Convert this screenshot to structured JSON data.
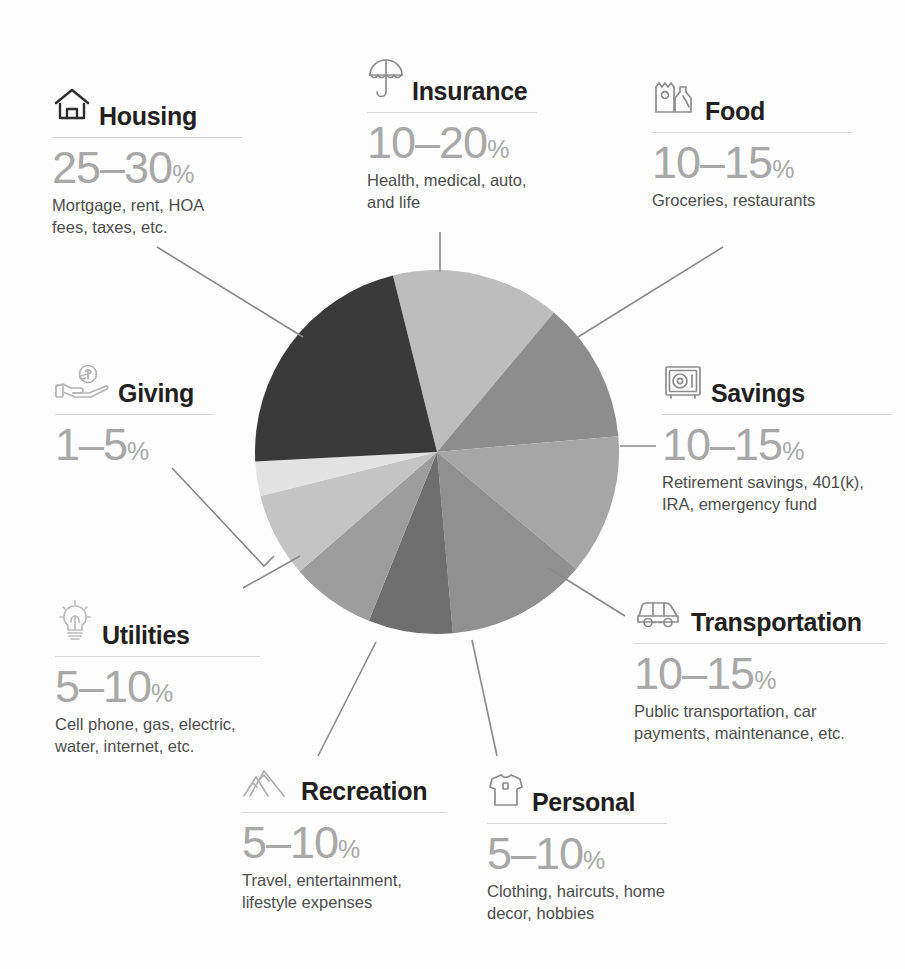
{
  "chart_data": {
    "type": "pie",
    "grid": false,
    "legend": "around-chart-callouts",
    "categories": [
      "Insurance",
      "Food",
      "Savings",
      "Transportation",
      "Personal",
      "Recreation",
      "Utilities",
      "Giving",
      "Housing"
    ],
    "values": [
      15,
      12.5,
      12.5,
      12.5,
      7.5,
      7.5,
      7.5,
      3,
      27.5
    ],
    "units": "percent",
    "slices": [
      {
        "label": "Insurance",
        "range": "10-20%",
        "min": 10,
        "max": 20,
        "value": 15,
        "color": "#bdbdbd",
        "start_angle": -14,
        "sweep": 54
      },
      {
        "label": "Food",
        "range": "10-15%",
        "min": 10,
        "max": 15,
        "value": 12.5,
        "color": "#8d8d8d",
        "start_angle": 40,
        "sweep": 45
      },
      {
        "label": "Savings",
        "range": "10-15%",
        "min": 10,
        "max": 15,
        "value": 12.5,
        "color": "#a6a6a6",
        "start_angle": 85,
        "sweep": 45
      },
      {
        "label": "Transportation",
        "range": "10-15%",
        "min": 10,
        "max": 15,
        "value": 12.5,
        "color": "#909090",
        "start_angle": 130,
        "sweep": 45
      },
      {
        "label": "Personal",
        "range": "5-10%",
        "min": 5,
        "max": 10,
        "value": 7.5,
        "color": "#6e6e6e",
        "start_angle": 175,
        "sweep": 27
      },
      {
        "label": "Recreation",
        "range": "5-10%",
        "min": 5,
        "max": 10,
        "value": 7.5,
        "color": "#9d9d9d",
        "start_angle": 202,
        "sweep": 27
      },
      {
        "label": "Utilities",
        "range": "5-10%",
        "min": 5,
        "max": 10,
        "value": 7.5,
        "color": "#c4c4c4",
        "start_angle": 229,
        "sweep": 27
      },
      {
        "label": "Giving",
        "range": "1-5%",
        "min": 1,
        "max": 5,
        "value": 3,
        "color": "#e2e2e2",
        "start_angle": 256,
        "sweep": 11
      },
      {
        "label": "Housing",
        "range": "25-30%",
        "min": 25,
        "max": 30,
        "value": 27.5,
        "color": "#3a3a3a",
        "start_angle": 267,
        "sweep": 79
      }
    ],
    "center": {
      "x": 437,
      "y": 452
    },
    "radius": 182
  },
  "categories": {
    "housing": {
      "title": "Housing",
      "percent": "25–30",
      "unit": "%",
      "desc": "Mortgage, rent, HOA fees, taxes, etc.",
      "icon": "house-icon"
    },
    "insurance": {
      "title": "Insurance",
      "percent": "10–20",
      "unit": "%",
      "desc": "Health, medical, auto, and life",
      "icon": "umbrella-icon"
    },
    "food": {
      "title": "Food",
      "percent": "10–15",
      "unit": "%",
      "desc": "Groceries, restaurants",
      "icon": "grocery-bag-icon"
    },
    "savings": {
      "title": "Savings",
      "percent": "10–15",
      "unit": "%",
      "desc": "Retirement savings, 401(k), IRA, emergency fund",
      "icon": "safe-icon"
    },
    "transportation": {
      "title": "Transportation",
      "percent": "10–15",
      "unit": "%",
      "desc": "Public transportation, car payments, maintenance, etc.",
      "icon": "car-icon"
    },
    "personal": {
      "title": "Personal",
      "percent": "5–10",
      "unit": "%",
      "desc": "Clothing, haircuts, home decor, hobbies",
      "icon": "tshirt-icon"
    },
    "recreation": {
      "title": "Recreation",
      "percent": "5–10",
      "unit": "%",
      "desc": "Travel, entertainment, lifestyle expenses",
      "icon": "mountains-icon"
    },
    "utilities": {
      "title": "Utilities",
      "percent": "5–10",
      "unit": "%",
      "desc": "Cell phone, gas, electric, water, internet, etc.",
      "icon": "lightbulb-icon"
    },
    "giving": {
      "title": "Giving",
      "percent": "1–5",
      "unit": "%",
      "desc": "",
      "icon": "hand-coin-icon"
    }
  },
  "colors": {
    "background": "#fdfdfd",
    "title_text": "#231f20",
    "percent_text": "#a8a8a8",
    "desc_text": "#4d4d4d",
    "rule": "#d9d9d9",
    "icon_stroke": "#8c8c8c",
    "connector": "#8a8a8a"
  }
}
